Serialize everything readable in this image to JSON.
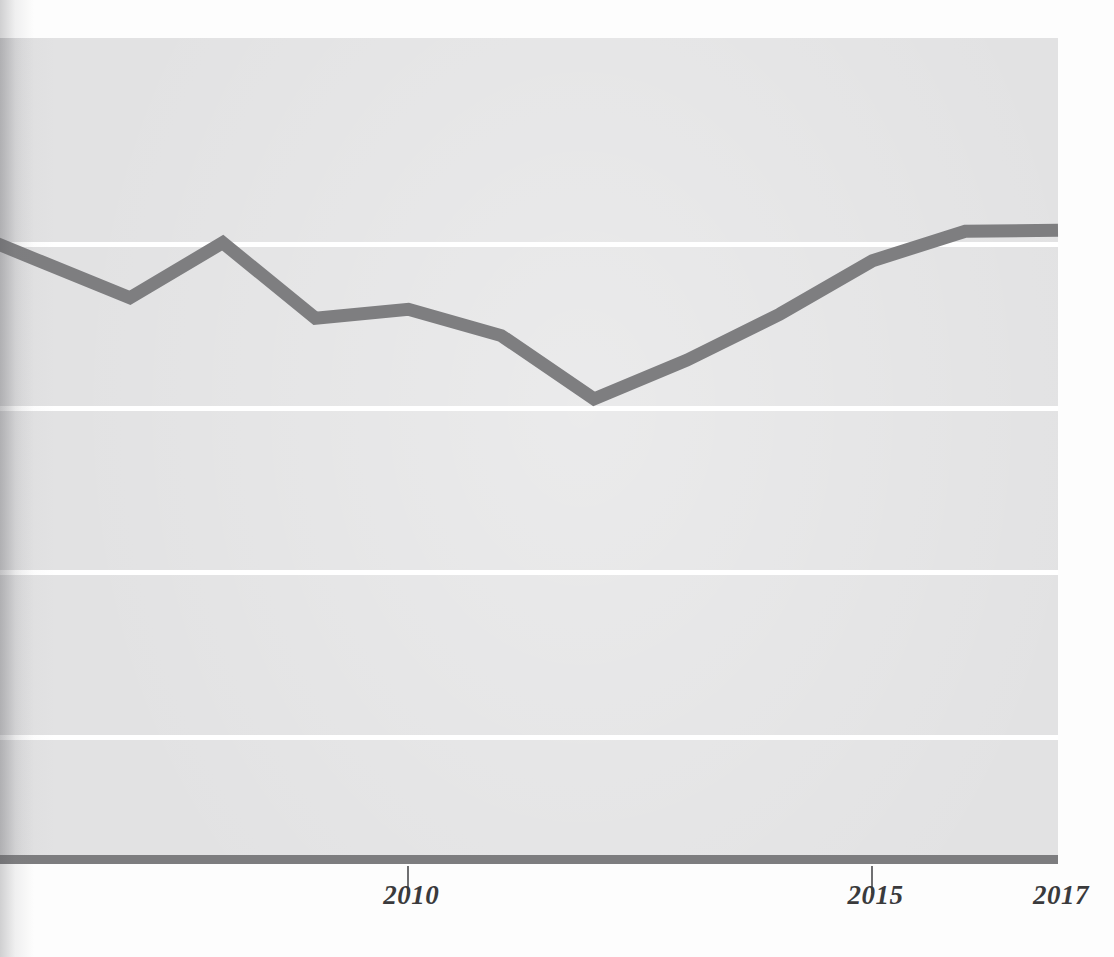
{
  "figure": {
    "kind": "scanned-book-line-chart",
    "background_color": "#fdfdfd",
    "panel_color": "#e2e2e3",
    "gridline_color": "#ffffff",
    "axis_color": "#7d7d7f",
    "line_color": "#7e7e80",
    "tick_label_color": "#3a3a3c"
  },
  "chart_data": {
    "type": "line",
    "title": "",
    "subtitle": "",
    "xlabel": "",
    "ylabel": "",
    "x": [
      2006,
      2007,
      2008,
      2009,
      2010,
      2011,
      2012,
      2013,
      2014,
      2015,
      2016,
      2017
    ],
    "series": [
      {
        "name": "series-1",
        "values": [
          73.0,
          68.4,
          75.1,
          65.9,
          67.0,
          63.8,
          56.1,
          60.8,
          66.4,
          72.9,
          76.5,
          76.6
        ]
      }
    ],
    "tick_labels_x": [
      "2010",
      "2015",
      "2017"
    ],
    "tick_label_x_positions": [
      2010,
      2015,
      2017
    ],
    "tick_marks_x": [
      "2010",
      "2015"
    ],
    "tick_labels_y": [],
    "ylim": [
      0,
      100
    ],
    "xlim": [
      2005.6,
      2017.0
    ],
    "grid": "horizontal",
    "gridline_values": [
      75,
      55,
      35,
      15
    ],
    "legend": "none",
    "annotations": []
  },
  "axis": {
    "x_ticks": [
      {
        "label": "2010",
        "has_mark": true
      },
      {
        "label": "2015",
        "has_mark": true
      },
      {
        "label": "2017",
        "has_mark": false
      }
    ]
  },
  "ghosts": {
    "upper_right": "",
    "lower_band": ""
  }
}
